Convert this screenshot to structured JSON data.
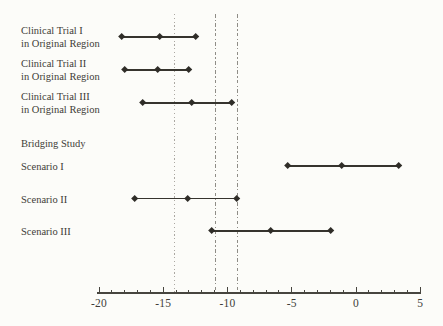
{
  "figure": {
    "background": "#fcfcf9",
    "text_color": "#3f3d38",
    "line_color": "#36342e",
    "marker_color": "#2f2d28",
    "reference_dotted_color": "#aba8a2",
    "reference_dashdot_color": "#8f8d87"
  },
  "chart_data": {
    "type": "forest",
    "title": "",
    "xlabel": "",
    "ylabel": "",
    "xlim": [
      -20,
      5
    ],
    "grid": false,
    "legend": "none",
    "marker_shape": "diamond",
    "x_axis": {
      "minor_tick_step": 1,
      "major_ticks": [
        {
          "value": -20,
          "label": "-20"
        },
        {
          "value": -15,
          "label": "-15"
        },
        {
          "value": -10,
          "label": "-10"
        },
        {
          "value": -5,
          "label": "-5"
        },
        {
          "value": 0,
          "label": "0"
        },
        {
          "value": 5,
          "label": "5"
        }
      ]
    },
    "reference_lines": [
      {
        "value": -14.1,
        "style": "dotted"
      },
      {
        "value": -10.9,
        "style": "dashdot"
      },
      {
        "value": -9.2,
        "style": "dashdot"
      }
    ],
    "rows": [
      {
        "label": [
          "Clinical Trial I",
          "in Original Region"
        ],
        "lower": -18.2,
        "point": -15.3,
        "upper": -12.5
      },
      {
        "label": [
          "Clinical Trial II",
          "in Original Region"
        ],
        "lower": -18.0,
        "point": -15.4,
        "upper": -13.0
      },
      {
        "label": [
          "Clinical Trial III",
          "in Original Region"
        ],
        "lower": -16.6,
        "point": -12.8,
        "upper": -9.7
      },
      {
        "label": [
          "Bridging Study"
        ],
        "header": true
      },
      {
        "label": [
          "Scenario I"
        ],
        "lower": -5.3,
        "point": -1.1,
        "upper": 3.3
      },
      {
        "label": [
          "Scenario II"
        ],
        "lower": -17.2,
        "point": -13.1,
        "upper": -9.3
      },
      {
        "label": [
          "Scenario III"
        ],
        "lower": -11.2,
        "point": -6.6,
        "upper": -2.0
      }
    ]
  }
}
